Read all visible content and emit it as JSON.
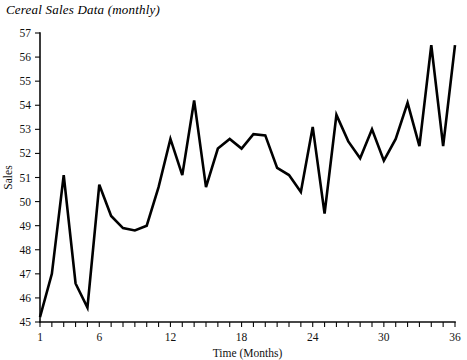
{
  "chart_data": {
    "type": "line",
    "title": "Cereal Sales Data (monthly)",
    "xlabel": "Time (Months)",
    "ylabel": "Sales",
    "xlim": [
      1,
      36
    ],
    "ylim": [
      45,
      57
    ],
    "grid": false,
    "legend": null,
    "x_tick_labels": [
      "1",
      "6",
      "12",
      "18",
      "24",
      "30",
      "36"
    ],
    "x_tick_values": [
      1,
      6,
      12,
      18,
      24,
      30,
      36
    ],
    "x_minor_ticks_every": 1,
    "y_tick_labels": [
      "45",
      "46",
      "47",
      "48",
      "49",
      "50",
      "51",
      "52",
      "53",
      "54",
      "55",
      "56",
      "57"
    ],
    "y_tick_values": [
      45,
      46,
      47,
      48,
      49,
      50,
      51,
      52,
      53,
      54,
      55,
      56,
      57
    ],
    "x": [
      1,
      2,
      3,
      4,
      5,
      6,
      7,
      8,
      9,
      10,
      11,
      12,
      13,
      14,
      15,
      16,
      17,
      18,
      19,
      20,
      21,
      22,
      23,
      24,
      25,
      26,
      27,
      28,
      29,
      30,
      31,
      32,
      33,
      34,
      35,
      36
    ],
    "values": [
      45.2,
      47.0,
      51.1,
      46.6,
      45.6,
      50.7,
      49.4,
      48.9,
      48.8,
      49.0,
      50.6,
      52.6,
      51.1,
      54.2,
      50.6,
      52.2,
      52.6,
      52.2,
      52.8,
      52.75,
      51.4,
      51.1,
      50.4,
      53.1,
      49.5,
      53.6,
      52.5,
      51.8,
      53.0,
      51.7,
      52.6,
      54.1,
      52.3,
      56.5,
      52.3,
      56.5
    ],
    "series": [
      {
        "name": "Cereal Sales",
        "color": "#000000",
        "values": [
          45.2,
          47.0,
          51.1,
          46.6,
          45.6,
          50.7,
          49.4,
          48.9,
          48.8,
          49.0,
          50.6,
          52.6,
          51.1,
          54.2,
          50.6,
          52.2,
          52.6,
          52.2,
          52.8,
          52.75,
          51.4,
          51.1,
          50.4,
          53.1,
          49.5,
          53.6,
          52.5,
          51.8,
          53.0,
          51.7,
          52.6,
          54.1,
          52.3,
          56.5,
          52.3,
          56.5
        ]
      }
    ]
  },
  "axes": {
    "y_label": "Sales",
    "x_label": "Time (Months)"
  }
}
